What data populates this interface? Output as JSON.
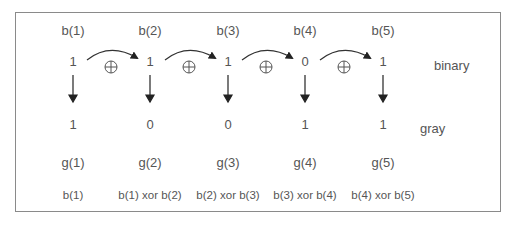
{
  "diagram": {
    "columns": [
      {
        "b_label": "b(1)",
        "binary": "1",
        "gray": "1",
        "g_label": "g(1)",
        "formula": "b(1)"
      },
      {
        "b_label": "b(2)",
        "binary": "1",
        "gray": "0",
        "g_label": "g(2)",
        "formula": "b(1) xor b(2)"
      },
      {
        "b_label": "b(3)",
        "binary": "1",
        "gray": "0",
        "g_label": "g(3)",
        "formula": "b(2) xor b(3)"
      },
      {
        "b_label": "b(4)",
        "binary": "0",
        "gray": "1",
        "g_label": "g(4)",
        "formula": "b(3) xor b(4)"
      },
      {
        "b_label": "b(5)",
        "binary": "1",
        "gray": "1",
        "g_label": "g(5)",
        "formula": "b(4) xor b(5)"
      }
    ],
    "row_labels": {
      "binary": "binary",
      "gray": "gray"
    },
    "operator_symbol": "xor-circle",
    "colors": {
      "text": "#555555",
      "arrow": "#222222",
      "border": "#8a8a8a"
    }
  }
}
